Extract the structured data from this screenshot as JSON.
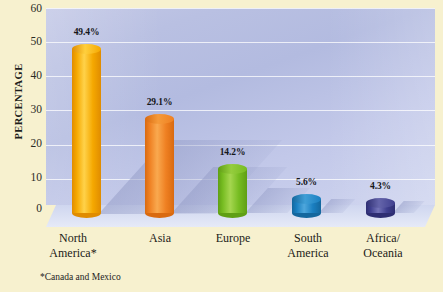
{
  "chart_data": {
    "type": "bar",
    "title": "",
    "subtitle": "",
    "xlabel": "",
    "ylabel": "PERCENTAGE",
    "ylim": [
      0,
      60
    ],
    "yticks": [
      0,
      10,
      20,
      30,
      40,
      50,
      60
    ],
    "ytick_labels": [
      "0",
      "10",
      "20",
      "30",
      "40",
      "50",
      "60"
    ],
    "grid": true,
    "legend": "none",
    "categories": [
      "North America*",
      "Asia",
      "Europe",
      "South America",
      "Africa/ Oceania"
    ],
    "values": [
      49.4,
      29.1,
      14.2,
      5.6,
      4.3
    ],
    "value_labels": [
      "49.4%",
      "29.1%",
      "14.2%",
      "5.6%",
      "4.3%"
    ],
    "annotations": [
      "*Canada and Mexico"
    ],
    "series": [
      {
        "name": "Percentage",
        "values": [
          49.4,
          29.1,
          14.2,
          5.6,
          4.3
        ]
      }
    ],
    "bars": [
      {
        "category_lines": [
          "North",
          "America*"
        ],
        "value": 49.4,
        "label": "49.4%",
        "color": "#f5a800",
        "color_light": "#ffd24a",
        "color_dark": "#e08c00",
        "top_color": "#ffcf3d"
      },
      {
        "category_lines": [
          "Asia",
          ""
        ],
        "value": 29.1,
        "label": "29.1%",
        "color": "#ef8022",
        "color_light": "#f9a94f",
        "color_dark": "#d96a10",
        "top_color": "#f59a39"
      },
      {
        "category_lines": [
          "Europe",
          ""
        ],
        "value": 14.2,
        "label": "14.2%",
        "color": "#76bc21",
        "color_light": "#a5d64f",
        "color_dark": "#5f9f14",
        "top_color": "#95cd3d"
      },
      {
        "category_lines": [
          "South",
          "America"
        ],
        "value": 5.6,
        "label": "5.6%",
        "color": "#1a7fc1",
        "color_light": "#4fa7dc",
        "color_dark": "#14679e",
        "top_color": "#3f9ed6"
      },
      {
        "category_lines": [
          "Africa/",
          "Oceania"
        ],
        "value": 4.3,
        "label": "4.3%",
        "color": "#3f3f8f",
        "color_light": "#7474b8",
        "color_dark": "#2e2e72",
        "top_color": "#6464aa"
      }
    ],
    "colors": {
      "page_background": "#f7f1cf",
      "plot_background": "#b9c0e2",
      "gridline": "#ffffff",
      "floor": "#d9dff3",
      "text": "#1b1b17"
    }
  }
}
